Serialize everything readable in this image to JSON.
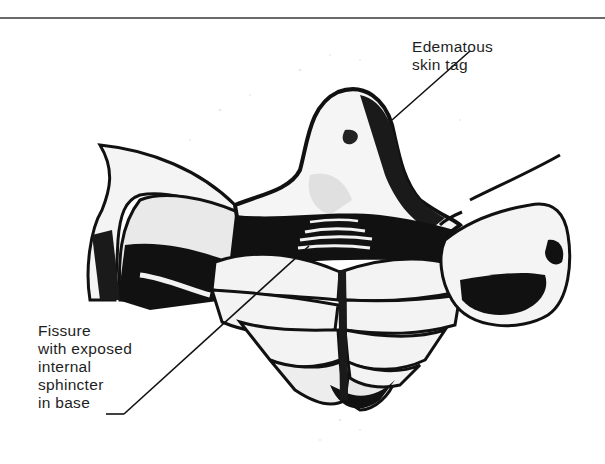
{
  "figure": {
    "type": "medical-illustration",
    "labels": [
      {
        "id": "skin-tag",
        "lines": [
          "Edematous",
          "skin tag"
        ],
        "leader": {
          "from": [
            470,
            51
          ],
          "to": [
            392,
            120
          ]
        }
      },
      {
        "id": "fissure",
        "lines": [
          "Fissure",
          "with exposed",
          "internal",
          "sphincter",
          "in base"
        ],
        "leader": {
          "tick_from": [
            106,
            414
          ],
          "tick_to": [
            124,
            414
          ],
          "to": [
            309,
            246
          ]
        }
      }
    ],
    "colors": {
      "ink": "#111111",
      "text": "#1e1e1e",
      "rule": "#6a6a6a",
      "background": "#ffffff"
    }
  }
}
